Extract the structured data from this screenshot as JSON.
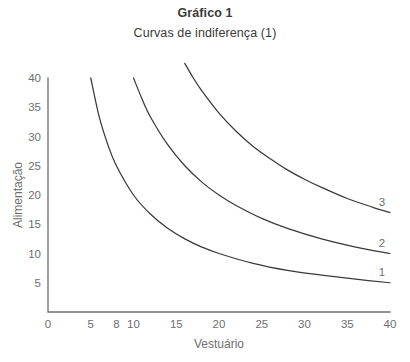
{
  "chart_data": {
    "type": "line",
    "title": "Gráfico 1",
    "subtitle": "Curvas de indiferença (1)",
    "xlabel": "Vestuário",
    "ylabel": "Alimentação",
    "xlim": [
      0,
      40
    ],
    "ylim": [
      0,
      40
    ],
    "grid": false,
    "legend": "inline-right-end-labels",
    "xticks": [
      0,
      5,
      8,
      10,
      15,
      20,
      25,
      30,
      35,
      40
    ],
    "xticklabels": [
      "0",
      "5",
      "8",
      "10",
      "15",
      "20",
      "25",
      "30",
      "35",
      "40"
    ],
    "yticks": [
      5,
      10,
      15,
      20,
      25,
      30,
      35,
      40
    ],
    "yticklabels": [
      "5",
      "10",
      "15",
      "20",
      "25",
      "30",
      "35",
      "40"
    ],
    "series": [
      {
        "name": "1",
        "label": "1",
        "constant": 200,
        "color": "#3a3a3a",
        "x": [
          5,
          6,
          7,
          8,
          10,
          12,
          14,
          16,
          18,
          20,
          24,
          28,
          32,
          36,
          40
        ],
        "y": [
          40,
          33.3,
          28.6,
          25,
          20,
          16.7,
          14.3,
          12.5,
          11.1,
          10,
          8.3,
          7.1,
          6.3,
          5.6,
          5
        ]
      },
      {
        "name": "2",
        "label": "2",
        "constant": 400,
        "color": "#3a3a3a",
        "x": [
          10,
          11,
          12,
          14,
          16,
          18,
          20,
          22,
          25,
          28,
          32,
          36,
          40
        ],
        "y": [
          40,
          36.4,
          33.3,
          28.6,
          25,
          22.2,
          20,
          18.2,
          16,
          14.3,
          12.5,
          11.1,
          10
        ]
      },
      {
        "name": "3",
        "label": "3",
        "constant": 680,
        "color": "#3a3a3a",
        "x": [
          16,
          17,
          18,
          20,
          22,
          24,
          26,
          28,
          30,
          32,
          35,
          38,
          40
        ],
        "y": [
          42.5,
          40,
          37.8,
          34,
          30.9,
          28.3,
          26.2,
          24.3,
          22.7,
          21.3,
          19.4,
          17.9,
          17
        ]
      }
    ]
  }
}
